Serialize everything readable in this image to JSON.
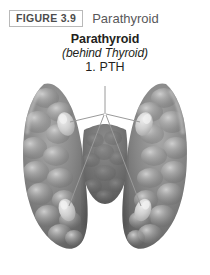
{
  "figure": {
    "number_label": "FIGURE 3.9",
    "header_title": "Parathyroid"
  },
  "caption": {
    "title": "Parathyroid",
    "subtitle": "(behind Thyroid)",
    "hormone_label": "1. PTH"
  },
  "illustration": {
    "name": "thyroid-gland-posterior-view",
    "description": "Grayscale posterior view of the thyroid gland showing two lateral lobes joined at an isthmus, with four embedded parathyroid glands indicated by leader lines converging on the PTH label.",
    "view": "posterior",
    "organ": "thyroid-gland",
    "parathyroid_gland_count": 4,
    "parathyroid_glands": [
      {
        "name": "superior-left-parathyroid",
        "position": "superior-left"
      },
      {
        "name": "superior-right-parathyroid",
        "position": "superior-right"
      },
      {
        "name": "inferior-left-parathyroid",
        "position": "inferior-left"
      },
      {
        "name": "inferior-right-parathyroid",
        "position": "inferior-right"
      }
    ],
    "leader_line_count": 4,
    "colors": {
      "gland_dark": "#5c5c5c",
      "gland_mid": "#8a8a8a",
      "gland_light": "#c9c9c9",
      "gland_highlight": "#e3e3e3",
      "leader_line": "#8f8f8f",
      "background": "#ffffff"
    }
  }
}
